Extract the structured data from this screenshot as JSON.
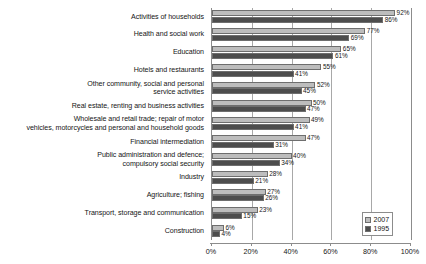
{
  "chart_data": {
    "type": "bar",
    "orientation": "horizontal",
    "title": "",
    "xlabel": "",
    "ylabel": "",
    "xlim": [
      0,
      100
    ],
    "grid": true,
    "legend_position": "bottom-right",
    "xticks": [
      "0%",
      "20%",
      "40%",
      "60%",
      "80%",
      "100%"
    ],
    "xtick_values": [
      0,
      20,
      40,
      60,
      80,
      100
    ],
    "categories": [
      "Activities of households",
      "Health and social work",
      "Education",
      "Hotels and restaurants",
      "Other community, social and personal\nservice activities",
      "Real estate, renting and business activities",
      "Wholesale and retail trade; repair of motor\nvehicles, motorcycles and personal and household goods",
      "Financial intermediation",
      "Public administration and defence;\ncompulsory social security",
      "Industry",
      "Agriculture; fishing",
      "Transport, storage and communication",
      "Construction"
    ],
    "series": [
      {
        "name": "2007",
        "color": "#bdbdbd",
        "values": [
          92,
          77,
          65,
          55,
          52,
          50,
          49,
          47,
          40,
          28,
          27,
          23,
          6
        ],
        "labels": [
          "92%",
          "77%",
          "65%",
          "55%",
          "52%",
          "50%",
          "49%",
          "47%",
          "40%",
          "28%",
          "27%",
          "23%",
          "6%"
        ]
      },
      {
        "name": "1995",
        "color": "#4d4d4d",
        "values": [
          86,
          69,
          61,
          41,
          45,
          47,
          41,
          31,
          34,
          21,
          26,
          15,
          4
        ],
        "labels": [
          "86%",
          "69%",
          "61%",
          "41%",
          "45%",
          "47%",
          "41%",
          "31%",
          "34%",
          "21%",
          "26%",
          "15%",
          "4%"
        ]
      }
    ]
  }
}
